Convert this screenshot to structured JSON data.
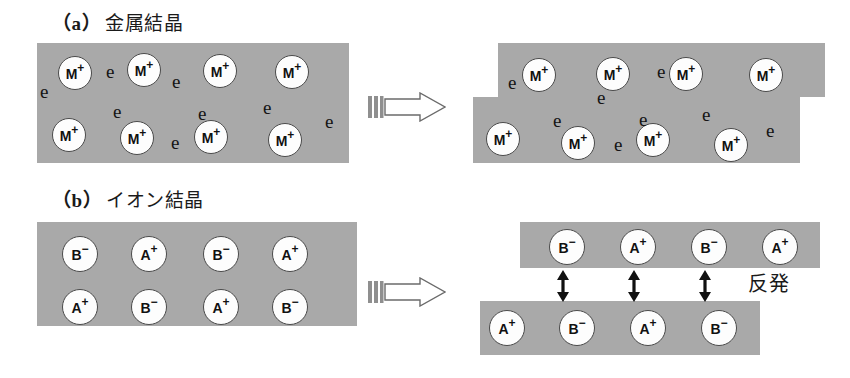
{
  "figure": {
    "sections": [
      {
        "id": "a",
        "tag": "（a）",
        "title": "金属結晶",
        "caption_x": 52,
        "caption_y": 8
      },
      {
        "id": "b",
        "tag": "（b）",
        "title": "イオン結晶",
        "caption_x": 52,
        "caption_y": 185
      }
    ],
    "push_arrows": [
      {
        "name": "push-arrow-metal",
        "x": 368,
        "y": 92,
        "w": 78,
        "h": 30
      },
      {
        "name": "push-arrow-ionic",
        "x": 368,
        "y": 277,
        "w": 78,
        "h": 30
      }
    ],
    "repulsion": {
      "label": "反発",
      "label_x": 748,
      "label_y": 268,
      "arrows": [
        {
          "x": 563,
          "y": 270,
          "h": 32
        },
        {
          "x": 634,
          "y": 270,
          "h": 32
        },
        {
          "x": 705,
          "y": 270,
          "h": 32
        }
      ]
    },
    "metal": {
      "electron_symbol": "e",
      "ion_symbol": "M",
      "ion_charge": "+",
      "before": {
        "slabs": [
          {
            "x": 37,
            "y": 43,
            "w": 312,
            "h": 120
          }
        ],
        "ions": [
          {
            "x": 58,
            "y": 56
          },
          {
            "x": 127,
            "y": 53
          },
          {
            "x": 203,
            "y": 54
          },
          {
            "x": 275,
            "y": 55
          },
          {
            "x": 52,
            "y": 118
          },
          {
            "x": 120,
            "y": 121
          },
          {
            "x": 194,
            "y": 120
          },
          {
            "x": 268,
            "y": 123
          }
        ],
        "electrons": [
          {
            "x": 40,
            "y": 82
          },
          {
            "x": 106,
            "y": 62
          },
          {
            "x": 172,
            "y": 72
          },
          {
            "x": 113,
            "y": 102
          },
          {
            "x": 198,
            "y": 104
          },
          {
            "x": 263,
            "y": 98
          },
          {
            "x": 171,
            "y": 133
          },
          {
            "x": 325,
            "y": 112
          }
        ]
      },
      "after": {
        "slabs": [
          {
            "x": 498,
            "y": 43,
            "w": 327,
            "h": 54
          },
          {
            "x": 473,
            "y": 97,
            "w": 327,
            "h": 66
          }
        ],
        "ions": [
          {
            "x": 522,
            "y": 58
          },
          {
            "x": 596,
            "y": 57
          },
          {
            "x": 669,
            "y": 57
          },
          {
            "x": 749,
            "y": 58
          },
          {
            "x": 486,
            "y": 122
          },
          {
            "x": 561,
            "y": 126
          },
          {
            "x": 636,
            "y": 123
          },
          {
            "x": 714,
            "y": 128
          }
        ],
        "electrons": [
          {
            "x": 508,
            "y": 73
          },
          {
            "x": 657,
            "y": 62
          },
          {
            "x": 597,
            "y": 88
          },
          {
            "x": 553,
            "y": 111
          },
          {
            "x": 639,
            "y": 110
          },
          {
            "x": 702,
            "y": 105
          },
          {
            "x": 614,
            "y": 135
          },
          {
            "x": 766,
            "y": 121
          }
        ]
      }
    },
    "ionic": {
      "cation": {
        "symbol": "A",
        "charge": "+"
      },
      "anion": {
        "symbol": "B",
        "charge": "−"
      },
      "before": {
        "slabs": [
          {
            "x": 37,
            "y": 222,
            "w": 320,
            "h": 104
          }
        ],
        "ions": [
          {
            "x": 62,
            "y": 236,
            "kind": "anion"
          },
          {
            "x": 131,
            "y": 236,
            "kind": "cation"
          },
          {
            "x": 203,
            "y": 236,
            "kind": "anion"
          },
          {
            "x": 272,
            "y": 236,
            "kind": "cation"
          },
          {
            "x": 62,
            "y": 289,
            "kind": "cation"
          },
          {
            "x": 131,
            "y": 289,
            "kind": "anion"
          },
          {
            "x": 203,
            "y": 289,
            "kind": "cation"
          },
          {
            "x": 272,
            "y": 289,
            "kind": "anion"
          }
        ]
      },
      "after": {
        "slabs": [
          {
            "x": 520,
            "y": 222,
            "w": 300,
            "h": 46
          },
          {
            "x": 480,
            "y": 301,
            "w": 280,
            "h": 54
          }
        ],
        "ions": [
          {
            "x": 549,
            "y": 229,
            "kind": "anion"
          },
          {
            "x": 620,
            "y": 229,
            "kind": "cation"
          },
          {
            "x": 691,
            "y": 229,
            "kind": "anion"
          },
          {
            "x": 762,
            "y": 229,
            "kind": "cation"
          },
          {
            "x": 489,
            "y": 310,
            "kind": "cation"
          },
          {
            "x": 559,
            "y": 310,
            "kind": "anion"
          },
          {
            "x": 630,
            "y": 310,
            "kind": "cation"
          },
          {
            "x": 701,
            "y": 310,
            "kind": "anion"
          }
        ]
      }
    }
  }
}
